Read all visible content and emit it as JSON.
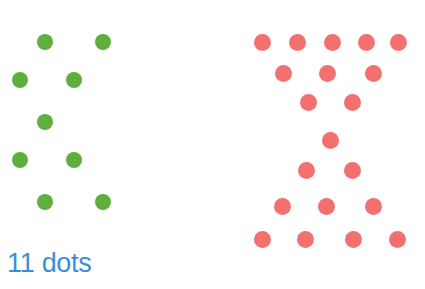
{
  "canvas": {
    "width": 425,
    "height": 289,
    "background_color": "#ffffff"
  },
  "label": {
    "text": "11 dots",
    "color": "#3a8fd4",
    "position": "bottom-left"
  },
  "chart_data": {
    "type": "scatter",
    "title": "",
    "xlabel": "",
    "ylabel": "",
    "grid": false,
    "legend": "none",
    "xlim": [
      0,
      425
    ],
    "ylim": [
      0,
      289
    ],
    "annotations": [
      "11 dots"
    ],
    "series": [
      {
        "name": "green-dots",
        "color": "#5faf3c",
        "count": 11,
        "dot_diameter": 16,
        "shape": "X / hourglass",
        "points": [
          {
            "x": 45,
            "y": 42
          },
          {
            "x": 103,
            "y": 42
          },
          {
            "x": 20,
            "y": 80
          },
          {
            "x": 74,
            "y": 80
          },
          {
            "x": 45,
            "y": 122
          },
          {
            "x": 20,
            "y": 160
          },
          {
            "x": 74,
            "y": 160
          },
          {
            "x": 45,
            "y": 202
          },
          {
            "x": 103,
            "y": 202
          },
          {
            "x": 45,
            "y": 42
          },
          {
            "x": 103,
            "y": 202
          }
        ]
      },
      {
        "name": "red-dots",
        "color": "#f4706e",
        "count": 20,
        "dot_diameter": 17,
        "shape": "X / hourglass",
        "points": [
          {
            "x": 262,
            "y": 42
          },
          {
            "x": 297,
            "y": 42
          },
          {
            "x": 332,
            "y": 42
          },
          {
            "x": 366,
            "y": 42
          },
          {
            "x": 398,
            "y": 42
          },
          {
            "x": 283,
            "y": 73
          },
          {
            "x": 327,
            "y": 73
          },
          {
            "x": 373,
            "y": 73
          },
          {
            "x": 308,
            "y": 102
          },
          {
            "x": 352,
            "y": 102
          },
          {
            "x": 330,
            "y": 140
          },
          {
            "x": 306,
            "y": 170
          },
          {
            "x": 352,
            "y": 170
          },
          {
            "x": 282,
            "y": 206
          },
          {
            "x": 326,
            "y": 206
          },
          {
            "x": 373,
            "y": 206
          },
          {
            "x": 262,
            "y": 239
          },
          {
            "x": 305,
            "y": 239
          },
          {
            "x": 353,
            "y": 239
          },
          {
            "x": 397,
            "y": 239
          }
        ]
      }
    ]
  }
}
